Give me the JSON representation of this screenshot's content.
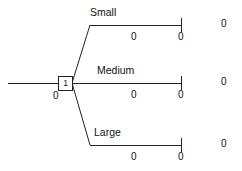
{
  "diagram": {
    "type": "decision-tree",
    "root": {
      "node_label": "1",
      "node_shape": "decision-square",
      "root_value": "0"
    },
    "branches": [
      {
        "name": "Small",
        "branch_value": "0",
        "terminal_value": "0",
        "payoff": "0"
      },
      {
        "name": "Medium",
        "branch_value": "0",
        "terminal_value": "0",
        "payoff": "0"
      },
      {
        "name": "Large",
        "branch_value": "0",
        "terminal_value": "0",
        "payoff": "0"
      }
    ]
  }
}
